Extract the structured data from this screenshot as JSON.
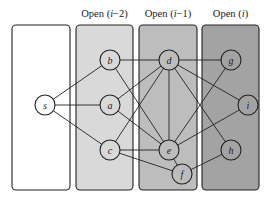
{
  "diagram": {
    "columns": [
      {
        "id": "col0",
        "title": "",
        "x": 12,
        "y": 25,
        "w": 58,
        "h": 165,
        "fill": "#ffffff"
      },
      {
        "id": "col1",
        "title_prefix": "Open (",
        "title_var": "i",
        "title_suffix": "−2)",
        "title": "Open (i−2)",
        "x": 76,
        "y": 25,
        "w": 57,
        "h": 165,
        "fill": "#d9d9d9"
      },
      {
        "id": "col2",
        "title_prefix": "Open (",
        "title_var": "i",
        "title_suffix": "−1)",
        "title": "Open (i−1)",
        "x": 139,
        "y": 25,
        "w": 58,
        "h": 165,
        "fill": "#bdbdbd"
      },
      {
        "id": "col3",
        "title_prefix": "Open (",
        "title_var": "i",
        "title_suffix": ")",
        "title": "Open (i)",
        "x": 202,
        "y": 25,
        "w": 57,
        "h": 165,
        "fill": "#a3a3a3"
      }
    ],
    "nodes": [
      {
        "id": "s",
        "label": "s",
        "x": 45,
        "y": 105
      },
      {
        "id": "b",
        "label": "b",
        "x": 110,
        "y": 60
      },
      {
        "id": "a",
        "label": "a",
        "x": 110,
        "y": 105
      },
      {
        "id": "c",
        "label": "c",
        "x": 110,
        "y": 150
      },
      {
        "id": "d",
        "label": "d",
        "x": 169,
        "y": 60
      },
      {
        "id": "e",
        "label": "e",
        "x": 169,
        "y": 150
      },
      {
        "id": "f",
        "label": "f",
        "x": 182,
        "y": 174
      },
      {
        "id": "g",
        "label": "g",
        "x": 231,
        "y": 60
      },
      {
        "id": "i",
        "label": "i",
        "x": 248,
        "y": 105
      },
      {
        "id": "h",
        "label": "h",
        "x": 231,
        "y": 150
      }
    ],
    "edges": [
      [
        "s",
        "b"
      ],
      [
        "s",
        "a"
      ],
      [
        "s",
        "c"
      ],
      [
        "b",
        "d"
      ],
      [
        "b",
        "e"
      ],
      [
        "a",
        "d"
      ],
      [
        "a",
        "e"
      ],
      [
        "c",
        "d"
      ],
      [
        "c",
        "e"
      ],
      [
        "c",
        "f"
      ],
      [
        "d",
        "e"
      ],
      [
        "d",
        "g"
      ],
      [
        "d",
        "i"
      ],
      [
        "d",
        "h"
      ],
      [
        "e",
        "g"
      ],
      [
        "e",
        "i"
      ],
      [
        "e",
        "f"
      ],
      [
        "f",
        "h"
      ]
    ],
    "node_radius": 10,
    "stroke_color": "#222222"
  }
}
